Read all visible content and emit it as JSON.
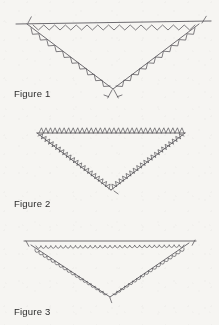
{
  "document": {
    "kind": "scanned-geometry-worksheet",
    "background_color": "#f6f5f2",
    "ink_color": "#555358",
    "width": 219,
    "height": 325
  },
  "figures": [
    {
      "id": "figure-1",
      "label": "Figure 1",
      "label_x": 14,
      "label_y": 88,
      "shape": "inverted-triangle",
      "decoration": "zigzag",
      "decoration_side": "inside",
      "vertices": {
        "left": [
          27,
          24
        ],
        "right": [
          199,
          24
        ],
        "bottom": [
          113,
          89
        ]
      },
      "line_extensions": {
        "left_overhang": [
          16,
          24
        ],
        "right_overhang": [
          211,
          21
        ],
        "bottom_tick_left": [
          104,
          97
        ],
        "bottom_tick_right": [
          123,
          97
        ]
      },
      "tick_marks": [
        "left-vertex-tick",
        "right-vertex-tick",
        "bottom-vertex-cross"
      ],
      "stroke_color": "#5a585c",
      "stroke_width": 0.8
    },
    {
      "id": "figure-2",
      "label": "Figure 2",
      "label_x": 14,
      "label_y": 198,
      "shape": "inverted-triangle",
      "decoration": "hook-hatch",
      "decoration_side": "outside",
      "vertices": {
        "left": [
          37,
          133
        ],
        "right": [
          185,
          133
        ],
        "bottom": [
          111,
          190
        ]
      },
      "line_extensions": {},
      "tick_marks": [],
      "stroke_color": "#5a585c",
      "stroke_width": 0.8
    },
    {
      "id": "figure-3",
      "label": "Figure 3",
      "label_x": 14,
      "label_y": 306,
      "shape": "inverted-triangle",
      "decoration": "loop-arch",
      "decoration_side": "inside",
      "vertices": {
        "left": [
          31,
          245
        ],
        "right": [
          189,
          243
        ],
        "bottom": [
          110,
          297
        ]
      },
      "line_extensions": {
        "left_overhang": [
          24,
          241
        ],
        "right_overhang": [
          196,
          241
        ]
      },
      "tick_marks": [
        "left-vertex-tick",
        "right-vertex-tick"
      ],
      "stroke_color": "#5a585c",
      "stroke_width": 0.8
    }
  ]
}
